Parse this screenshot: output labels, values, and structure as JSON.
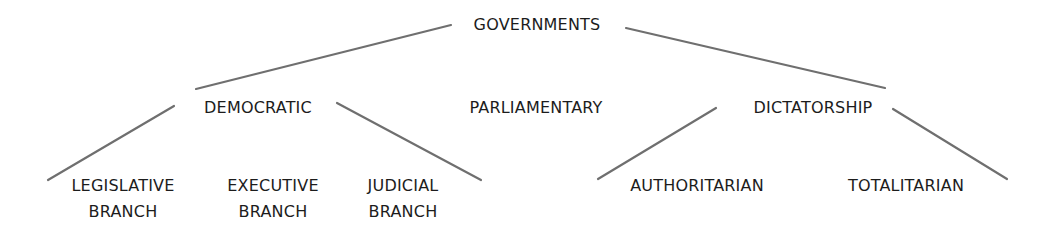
{
  "diagram": {
    "root": {
      "label": "GOVERNMENTS"
    },
    "level1": [
      {
        "label": "DEMOCRATIC"
      },
      {
        "label": "PARLIAMENTARY"
      },
      {
        "label": "DICTATORSHIP"
      }
    ],
    "democratic_children": [
      {
        "label": "LEGISLATIVE\nBRANCH"
      },
      {
        "label": "EXECUTIVE\nBRANCH"
      },
      {
        "label": "JUDICIAL\nBRANCH"
      }
    ],
    "dictatorship_children": [
      {
        "label": "AUTHORITARIAN"
      },
      {
        "label": "TOTALITARIAN"
      }
    ],
    "colors": {
      "line": "#6f6f6f",
      "text": "#1c1c1c",
      "background": "#ffffff"
    }
  }
}
